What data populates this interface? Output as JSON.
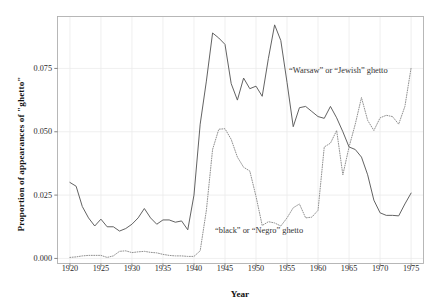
{
  "chart_data": {
    "type": "line",
    "title": "",
    "xlabel": "Year",
    "ylabel": "Proportion of appearances of \"ghetto\"",
    "xlim": [
      1918,
      1977
    ],
    "ylim": [
      -0.002,
      0.0955
    ],
    "grid": true,
    "legend_position": "inline-annotations",
    "x_ticks": [
      1920,
      1925,
      1930,
      1935,
      1940,
      1945,
      1950,
      1955,
      1960,
      1965,
      1970,
      1975
    ],
    "x_tick_labels": [
      "1920",
      "1925",
      "1930",
      "1935",
      "1940",
      "1945",
      "1950",
      "1955",
      "1960",
      "1965",
      "1970",
      "1975"
    ],
    "y_ticks": [
      0.0,
      0.025,
      0.05,
      0.075
    ],
    "y_tick_labels": [
      "0.000",
      "0.025",
      "0.050",
      "0.075"
    ],
    "colors": {
      "warsaw_line": "#5a5a5a",
      "black_line": "#8a8a8a",
      "grid": "#ebebeb",
      "panel_border": "#b0b0b0",
      "background": "#ffffff",
      "text": "#2a2a2a"
    },
    "annotations": [
      {
        "id": "warsaw",
        "text": "“Warsaw” or “Jewish” ghetto",
        "x": 1964.0,
        "y": 0.0735
      },
      {
        "id": "black",
        "text": "“black” or “Negro” ghetto",
        "x": 1954.0,
        "y": 0.0105
      }
    ],
    "x": [
      1920,
      1921,
      1922,
      1923,
      1924,
      1925,
      1926,
      1927,
      1928,
      1929,
      1930,
      1931,
      1932,
      1933,
      1934,
      1935,
      1936,
      1937,
      1938,
      1939,
      1940,
      1941,
      1942,
      1943,
      1944,
      1945,
      1946,
      1947,
      1948,
      1949,
      1950,
      1951,
      1952,
      1953,
      1954,
      1955,
      1956,
      1957,
      1958,
      1959,
      1960,
      1961,
      1962,
      1963,
      1964,
      1965,
      1966,
      1967,
      1968,
      1969,
      1970,
      1971,
      1972,
      1973,
      1974,
      1975
    ],
    "series": [
      {
        "name": "“Warsaw” or “Jewish” ghetto",
        "style": "solid",
        "color": "#5a5a5a",
        "values": [
          0.03,
          0.0285,
          0.0205,
          0.016,
          0.0128,
          0.0155,
          0.0125,
          0.0125,
          0.0108,
          0.0118,
          0.0135,
          0.016,
          0.0197,
          0.016,
          0.0135,
          0.0152,
          0.0152,
          0.0143,
          0.0148,
          0.0113,
          0.025,
          0.053,
          0.07,
          0.089,
          0.087,
          0.0845,
          0.069,
          0.0625,
          0.0712,
          0.067,
          0.068,
          0.064,
          0.079,
          0.0922,
          0.086,
          0.0695,
          0.052,
          0.0595,
          0.06,
          0.058,
          0.056,
          0.0553,
          0.06,
          0.0555,
          0.05,
          0.044,
          0.043,
          0.04,
          0.033,
          0.023,
          0.018,
          0.017,
          0.017,
          0.0168,
          0.0215,
          0.0258
        ]
      },
      {
        "name": "“black” or “Negro” ghetto",
        "style": "dotted",
        "color": "#8a8a8a",
        "values": [
          0.0004,
          0.0006,
          0.001,
          0.0012,
          0.0012,
          0.0012,
          0.0004,
          0.001,
          0.0028,
          0.003,
          0.0023,
          0.0026,
          0.0028,
          0.0024,
          0.0022,
          0.0016,
          0.0012,
          0.001,
          0.001,
          0.0008,
          0.0008,
          0.003,
          0.019,
          0.043,
          0.051,
          0.0512,
          0.047,
          0.04,
          0.036,
          0.0345,
          0.0245,
          0.013,
          0.0145,
          0.014,
          0.0128,
          0.016,
          0.02,
          0.0215,
          0.016,
          0.0163,
          0.019,
          0.044,
          0.0455,
          0.0505,
          0.033,
          0.044,
          0.053,
          0.0635,
          0.0545,
          0.0505,
          0.0555,
          0.0565,
          0.056,
          0.053,
          0.06,
          0.0752
        ]
      }
    ]
  }
}
